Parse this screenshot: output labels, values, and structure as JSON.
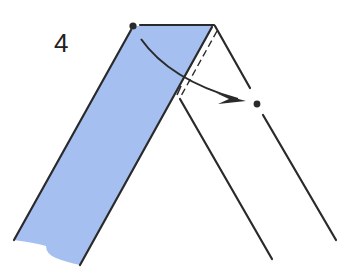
{
  "diagram": {
    "type": "origami-instruction-step",
    "step_number": "4",
    "colors": {
      "paper_colored_side": "#a4bff0",
      "line": "#2a2a2a",
      "background": "#ffffff"
    },
    "elements": [
      {
        "name": "colored-strip",
        "description": "Blue paper strip folded diagonally"
      },
      {
        "name": "valley-fold-line",
        "description": "Dashed fold line parallel to strip right edge"
      },
      {
        "name": "fold-arrow",
        "description": "Curved arrow from top-left corner dot to reference dot"
      },
      {
        "name": "start-point",
        "description": "Dot at top-left corner of strip"
      },
      {
        "name": "target-point",
        "description": "Dot on right edge line"
      }
    ]
  }
}
